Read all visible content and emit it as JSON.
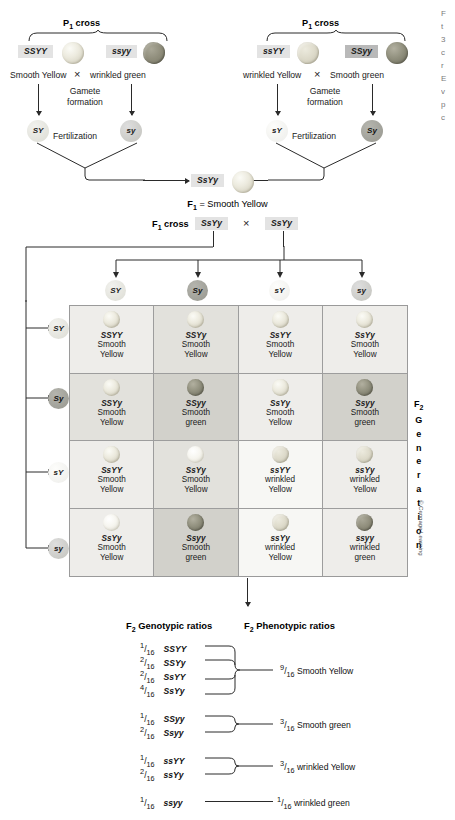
{
  "p1_left": {
    "heading": "P",
    "heading_sub": "1",
    "heading_rest": " cross",
    "parent_a": {
      "genotype": "SSYY",
      "phenotype": "Smooth Yellow",
      "seed": "smooth-yellow"
    },
    "parent_b": {
      "genotype": "ssyy",
      "phenotype": "wrinkled green",
      "seed": "wrinkled-green"
    },
    "cross_symbol": "×",
    "gamete_label": "Gamete\nformation",
    "gamete_line1": "Gamete",
    "gamete_line2": "formation",
    "gamete_a": "SY",
    "gamete_b": "sy",
    "fertilization": "Fertilization"
  },
  "p1_right": {
    "heading": "P",
    "heading_sub": "1",
    "heading_rest": " cross",
    "parent_a": {
      "genotype": "ssYY",
      "phenotype": "wrinkled Yellow",
      "seed": "wrinkled-yellow"
    },
    "parent_b": {
      "genotype": "SSyy",
      "phenotype": "Smooth green",
      "seed": "smooth-green"
    },
    "cross_symbol": "×",
    "gamete_line1": "Gamete",
    "gamete_line2": "formation",
    "gamete_a": "sY",
    "gamete_b": "Sy",
    "fertilization": "Fertilization"
  },
  "f1": {
    "genotype": "SsYy",
    "result_prefix": "F",
    "result_sub": "1",
    "result_text": " = Smooth Yellow",
    "cross_prefix": "F",
    "cross_sub": "1",
    "cross_text": " cross",
    "parent_a": "SsYy",
    "parent_b": "SsYy",
    "cross_symbol": "×"
  },
  "gametes": {
    "columns": [
      "SY",
      "Sy",
      "sY",
      "sy"
    ],
    "rows": [
      "SY",
      "Sy",
      "sY",
      "sy"
    ]
  },
  "punnett": {
    "cells": [
      {
        "genotype": "SSYY",
        "trait1": "Smooth",
        "trait2": "Yellow",
        "seed": "smooth-yellow",
        "bg": "bg-light"
      },
      {
        "genotype": "SSYy",
        "trait1": "Smooth",
        "trait2": "Yellow",
        "seed": "smooth-yellow",
        "bg": "bg-mid"
      },
      {
        "genotype": "SsYY",
        "trait1": "Smooth",
        "trait2": "Yellow",
        "seed": "smooth-yellow",
        "bg": "bg-light"
      },
      {
        "genotype": "SsYy",
        "trait1": "Smooth",
        "trait2": "Yellow",
        "seed": "smooth-yellow",
        "bg": "bg-light"
      },
      {
        "genotype": "SSYy",
        "trait1": "Smooth",
        "trait2": "Yellow",
        "seed": "smooth-yellow",
        "bg": "bg-mid"
      },
      {
        "genotype": "SSyy",
        "trait1": "Smooth",
        "trait2": "green",
        "seed": "smooth-green",
        "bg": "bg-dark"
      },
      {
        "genotype": "SsYy",
        "trait1": "Smooth",
        "trait2": "Yellow",
        "seed": "smooth-yellow",
        "bg": "bg-light"
      },
      {
        "genotype": "Ssyy",
        "trait1": "Smooth",
        "trait2": "green",
        "seed": "smooth-green",
        "bg": "bg-dark"
      },
      {
        "genotype": "SsYY",
        "trait1": "Smooth",
        "trait2": "Yellow",
        "seed": "smooth-yellow",
        "bg": "bg-light"
      },
      {
        "genotype": "SsYy",
        "trait1": "Smooth",
        "trait2": "Yellow",
        "seed": "smooth-pale",
        "bg": "bg-mid"
      },
      {
        "genotype": "ssYY",
        "trait1": "wrinkled",
        "trait2": "Yellow",
        "seed": "wrinkled-yellow",
        "bg": "bg-pale"
      },
      {
        "genotype": "ssYy",
        "trait1": "wrinkled",
        "trait2": "Yellow",
        "seed": "wrinkled-yellow",
        "bg": "bg-light"
      },
      {
        "genotype": "SsYy",
        "trait1": "Smooth",
        "trait2": "Yellow",
        "seed": "smooth-pale",
        "bg": "bg-light"
      },
      {
        "genotype": "Ssyy",
        "trait1": "Smooth",
        "trait2": "green",
        "seed": "smooth-green",
        "bg": "bg-dark"
      },
      {
        "genotype": "ssYy",
        "trait1": "wrinkled",
        "trait2": "Yellow",
        "seed": "wrinkled-yellow",
        "bg": "bg-pale"
      },
      {
        "genotype": "ssyy",
        "trait1": "wrinkled",
        "trait2": "green",
        "seed": "wrinkled-green",
        "bg": "bg-light"
      }
    ]
  },
  "f2_generation_label": {
    "main": "F",
    "sub": "2",
    "letters": [
      "G",
      "e",
      "n",
      "e",
      "r",
      "a",
      "t",
      "i",
      "o",
      "n"
    ]
  },
  "copyright": "© Cengage Learning",
  "ratios": {
    "genotypic_heading_prefix": "F",
    "genotypic_heading_sub": "2",
    "genotypic_heading_rest": " Genotypic ratios",
    "phenotypic_heading_prefix": "F",
    "phenotypic_heading_sub": "2",
    "phenotypic_heading_rest": " Phenotypic ratios",
    "groups": [
      {
        "items": [
          {
            "num": "1",
            "den": "16",
            "genotype": "SSYY"
          },
          {
            "num": "2",
            "den": "16",
            "genotype": "SSYy"
          },
          {
            "num": "2",
            "den": "16",
            "genotype": "SsYY"
          },
          {
            "num": "4",
            "den": "16",
            "genotype": "SsYy"
          }
        ],
        "result_num": "9",
        "result_den": "16",
        "result_text": "Smooth Yellow"
      },
      {
        "items": [
          {
            "num": "1",
            "den": "16",
            "genotype": "SSyy"
          },
          {
            "num": "2",
            "den": "16",
            "genotype": "Ssyy"
          }
        ],
        "result_num": "3",
        "result_den": "16",
        "result_text": "Smooth green"
      },
      {
        "items": [
          {
            "num": "1",
            "den": "16",
            "genotype": "ssYY"
          },
          {
            "num": "2",
            "den": "16",
            "genotype": "ssYy"
          }
        ],
        "result_num": "3",
        "result_den": "16",
        "result_text": "wrinkled Yellow"
      },
      {
        "items": [
          {
            "num": "1",
            "den": "16",
            "genotype": "ssyy"
          }
        ],
        "result_num": "1",
        "result_den": "16",
        "result_text": "wrinkled green"
      }
    ]
  },
  "caption_sliver": {
    "lines": [
      "F",
      "t",
      "3",
      "c",
      "r",
      "E",
      "v",
      "p",
      "c",
      "v",
      "v"
    ]
  }
}
